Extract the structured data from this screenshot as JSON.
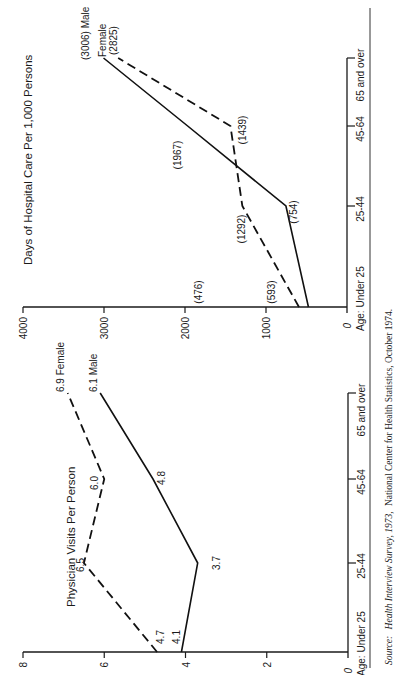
{
  "chart_data": [
    {
      "type": "line",
      "title": "Days of Hospital Care Per 1,000 Persons",
      "xlabel": "Age",
      "ylabel": "",
      "categories": [
        "Under 25",
        "25-44",
        "45-64",
        "65 and over"
      ],
      "category_axis_prefix": "Age:",
      "ylim": [
        0,
        4000
      ],
      "yticks": [
        "0",
        "1000",
        "2000",
        "3000",
        "4000"
      ],
      "series": [
        {
          "name": "Male",
          "style": "solid",
          "values": [
            476,
            754,
            1967,
            3006
          ],
          "labels": [
            "(476)",
            "(754)",
            "(1967)",
            "(3006) Male"
          ]
        },
        {
          "name": "Female",
          "style": "dashed",
          "values": [
            593,
            1292,
            1439,
            2825
          ],
          "labels": [
            "(593)",
            "(1292)",
            "(1439)",
            "Female (2825)"
          ]
        }
      ],
      "end_label_female_line1": "Female",
      "end_label_female_line2": "(2825)",
      "orientation": "rotated 90° counter-clockwise",
      "grid": false
    },
    {
      "type": "line",
      "title": "Physician Visits Per Person",
      "xlabel": "Age",
      "ylabel": "",
      "categories": [
        "Under 25",
        "25-44",
        "45-64",
        "65 and over"
      ],
      "category_axis_prefix": "Age:",
      "ylim": [
        0,
        8
      ],
      "yticks": [
        "0",
        "2",
        "4",
        "6",
        "8"
      ],
      "series": [
        {
          "name": "Male",
          "style": "solid",
          "values": [
            4.1,
            3.7,
            4.8,
            6.1
          ],
          "labels": [
            "4.1",
            "3.7",
            "4.8",
            "6.1 Male"
          ]
        },
        {
          "name": "Female",
          "style": "dashed",
          "values": [
            4.7,
            6.5,
            6.0,
            6.9
          ],
          "labels": [
            "4.7",
            "6.5",
            "6.0",
            "6.9 Female"
          ]
        }
      ],
      "orientation": "rotated 90° counter-clockwise",
      "grid": false
    }
  ],
  "source": {
    "prefix": "Source:",
    "title": "Health Interview Survey, 1973,",
    "rest": "National Center for Health Statistics, October 1974."
  }
}
